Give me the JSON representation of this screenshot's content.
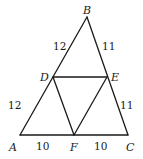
{
  "diagram": {
    "type": "geometry",
    "points": {
      "A": {
        "label": "A",
        "x": 20,
        "y": 135
      },
      "B": {
        "label": "B",
        "x": 87,
        "y": 17
      },
      "C": {
        "label": "C",
        "x": 128,
        "y": 135
      },
      "D": {
        "label": "D",
        "x": 53,
        "y": 77
      },
      "E": {
        "label": "E",
        "x": 107,
        "y": 77
      },
      "F": {
        "label": "F",
        "x": 74,
        "y": 135
      }
    },
    "segments": [
      {
        "from": "A",
        "to": "B"
      },
      {
        "from": "B",
        "to": "C"
      },
      {
        "from": "A",
        "to": "C"
      },
      {
        "from": "D",
        "to": "E"
      },
      {
        "from": "D",
        "to": "F"
      },
      {
        "from": "E",
        "to": "F"
      }
    ],
    "lengths": {
      "BD": "12",
      "DA": "12",
      "BE": "11",
      "EC": "11",
      "AF": "10",
      "FC": "10"
    }
  }
}
